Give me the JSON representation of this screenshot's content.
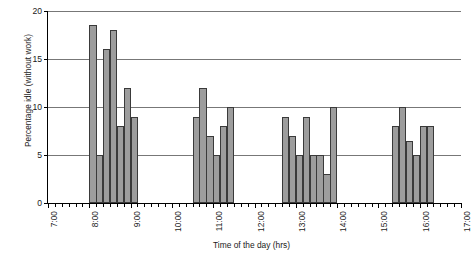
{
  "chart_data": {
    "type": "bar",
    "title": "",
    "xlabel": "Time of the day (hrs)",
    "ylabel": "Percentage idle (without work)",
    "ylim": [
      0,
      20
    ],
    "ytick_labels": [
      "0",
      "5",
      "10",
      "15",
      "20"
    ],
    "ytick_values": [
      0,
      5,
      10,
      15,
      20
    ],
    "grid": "horizontal",
    "legend": "none",
    "xlim_labels": [
      "7:00",
      "17:00"
    ],
    "xtick_labels": [
      "7:00",
      "8:00",
      "9:00",
      "10:00",
      "11:00",
      "12:00",
      "13:00",
      "14:00",
      "15:00",
      "16:00",
      "17:00"
    ],
    "xtick_values": [
      7,
      8,
      9,
      10,
      11,
      12,
      13,
      14,
      15,
      16,
      17
    ],
    "minor_tick_interval_minutes": 10,
    "bar_interval_minutes": 10,
    "categories": [
      "8:00",
      "8:10",
      "8:20",
      "8:30",
      "8:40",
      "8:50",
      "9:00",
      "10:30",
      "10:40",
      "10:50",
      "11:00",
      "11:10",
      "11:20",
      "12:40",
      "12:50",
      "13:00",
      "13:10",
      "13:20",
      "13:30",
      "13:40",
      "13:50",
      "14:10",
      "15:30",
      "15:40",
      "15:50",
      "16:00",
      "16:10",
      "16:20"
    ],
    "values": [
      18.5,
      5,
      16,
      18,
      8,
      12,
      9,
      9,
      12,
      7,
      5,
      8,
      10,
      9,
      7,
      5,
      9,
      5,
      5,
      3,
      10,
      10,
      8,
      10,
      6.5,
      5,
      8,
      8
    ],
    "bars": [
      {
        "start": 8.0,
        "value": 18.5
      },
      {
        "start": 8.1667,
        "value": 5
      },
      {
        "start": 8.3333,
        "value": 16
      },
      {
        "start": 8.5,
        "value": 18
      },
      {
        "start": 8.6667,
        "value": 8
      },
      {
        "start": 8.8333,
        "value": 12
      },
      {
        "start": 9.0,
        "value": 9
      },
      {
        "start": 10.5,
        "value": 9
      },
      {
        "start": 10.6667,
        "value": 12
      },
      {
        "start": 10.8333,
        "value": 7
      },
      {
        "start": 11.0,
        "value": 5
      },
      {
        "start": 11.1667,
        "value": 8
      },
      {
        "start": 11.3333,
        "value": 10
      },
      {
        "start": 12.6667,
        "value": 9
      },
      {
        "start": 12.8333,
        "value": 7
      },
      {
        "start": 13.0,
        "value": 5
      },
      {
        "start": 13.1667,
        "value": 9
      },
      {
        "start": 13.3333,
        "value": 5
      },
      {
        "start": 13.5,
        "value": 5
      },
      {
        "start": 13.6667,
        "value": 3
      },
      {
        "start": 13.8333,
        "value": 10
      },
      {
        "start": 15.3333,
        "value": 8
      },
      {
        "start": 15.5,
        "value": 10
      },
      {
        "start": 15.6667,
        "value": 6.5
      },
      {
        "start": 15.8333,
        "value": 5
      },
      {
        "start": 16.0,
        "value": 8
      },
      {
        "start": 16.1667,
        "value": 8
      }
    ],
    "colors": {
      "bar_fill": "#9d9d9d",
      "bar_stroke": "#3a3a3a",
      "axis": "#000000",
      "gridline": "#777777",
      "background": "#ffffff"
    }
  }
}
